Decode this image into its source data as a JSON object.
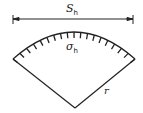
{
  "diagram": {
    "type": "circular-sector-stress-diagram",
    "labels": {
      "span": {
        "symbol": "S",
        "subscript": "h"
      },
      "stress": {
        "symbol": "σ",
        "subscript": "h"
      },
      "radius": {
        "symbol": "r"
      }
    },
    "colors": {
      "line": "#222222",
      "background": "#ffffff"
    }
  }
}
